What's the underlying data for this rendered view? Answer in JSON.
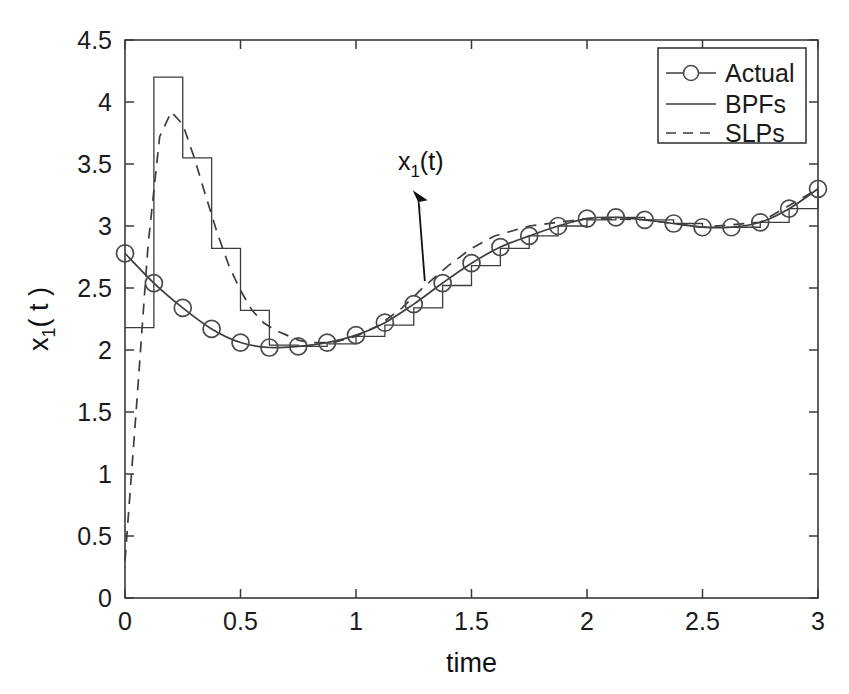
{
  "figure": {
    "background_color": "#ffffff",
    "axis_color": "#3a3a3a",
    "line_color": "#3d3d3d",
    "marker_color": "#4a4a4a"
  },
  "axes": {
    "x_label": "time",
    "y_label_base": "x",
    "y_label_sub": "1",
    "y_label_tail": "( t )",
    "x_ticks": [
      "0",
      "0.5",
      "1",
      "1.5",
      "2",
      "2.5",
      "3"
    ],
    "y_ticks": [
      "0",
      "0.5",
      "1",
      "1.5",
      "2",
      "2.5",
      "3",
      "3.5",
      "4",
      "4.5"
    ],
    "box": true,
    "grid": false
  },
  "annotation": {
    "text_base": "x",
    "text_sub": "1",
    "text_tail": "(t)",
    "arrow": "arrow-up-left"
  },
  "legend": {
    "position": "top-right",
    "entries": [
      {
        "label": "Actual",
        "style": "line-with-circle-marker"
      },
      {
        "label": "BPFs",
        "style": "solid-line"
      },
      {
        "label": "SLPs",
        "style": "dashed-line"
      }
    ]
  },
  "chart_data": {
    "type": "line",
    "title": "",
    "xlabel": "time",
    "ylabel": "x_1( t )",
    "xlim": [
      0,
      3
    ],
    "ylim": [
      0,
      4.5
    ],
    "xticks": [
      0,
      0.5,
      1,
      1.5,
      2,
      2.5,
      3
    ],
    "yticks": [
      0,
      0.5,
      1,
      1.5,
      2,
      2.5,
      3,
      3.5,
      4,
      4.5
    ],
    "grid": false,
    "legend_position": "upper right",
    "annotations": [
      {
        "text": "x_1(t)",
        "x": 1.28,
        "y": 3.45,
        "arrow_to_x": 1.22,
        "arrow_to_y": 2.62
      }
    ],
    "series": [
      {
        "name": "Actual",
        "style": "solid-with-circle-markers",
        "x": [
          0.0,
          0.125,
          0.25,
          0.375,
          0.5,
          0.625,
          0.75,
          0.875,
          1.0,
          1.125,
          1.25,
          1.375,
          1.5,
          1.625,
          1.75,
          1.875,
          2.0,
          2.125,
          2.25,
          2.375,
          2.5,
          2.625,
          2.75,
          2.875,
          3.0
        ],
        "y": [
          2.78,
          2.54,
          2.34,
          2.17,
          2.06,
          2.02,
          2.03,
          2.06,
          2.12,
          2.22,
          2.37,
          2.54,
          2.7,
          2.83,
          2.92,
          3.0,
          3.06,
          3.07,
          3.05,
          3.02,
          2.99,
          2.99,
          3.03,
          3.14,
          3.3
        ]
      },
      {
        "name": "BPFs",
        "style": "staircase",
        "x": [
          0.0,
          0.125,
          0.25,
          0.375,
          0.5,
          0.625,
          0.75,
          0.875,
          1.0,
          1.125,
          1.25,
          1.375,
          1.5,
          1.625,
          1.75,
          1.875,
          2.0,
          2.125,
          2.25,
          2.375,
          2.5,
          2.625,
          2.75,
          2.875,
          3.0
        ],
        "y": [
          2.18,
          4.2,
          3.55,
          2.82,
          2.32,
          2.04,
          2.03,
          2.05,
          2.11,
          2.2,
          2.34,
          2.52,
          2.68,
          2.82,
          2.92,
          3.0,
          3.05,
          3.07,
          3.05,
          3.02,
          2.99,
          2.99,
          3.03,
          3.14,
          3.3
        ]
      },
      {
        "name": "SLPs",
        "style": "dashed",
        "x": [
          0.0,
          0.05,
          0.1,
          0.15,
          0.2,
          0.25,
          0.3,
          0.35,
          0.4,
          0.45,
          0.5,
          0.55,
          0.6,
          0.65,
          0.7,
          0.75,
          0.8,
          0.9,
          1.0,
          1.1,
          1.2,
          1.3,
          1.4,
          1.5,
          1.6,
          1.75,
          2.0,
          2.25,
          2.5,
          2.75,
          3.0
        ],
        "y": [
          0.3,
          1.55,
          2.85,
          3.72,
          3.92,
          3.82,
          3.55,
          3.24,
          2.94,
          2.68,
          2.48,
          2.32,
          2.22,
          2.16,
          2.12,
          2.08,
          2.06,
          2.06,
          2.11,
          2.2,
          2.34,
          2.52,
          2.68,
          2.82,
          2.92,
          3.0,
          3.06,
          3.05,
          2.99,
          3.03,
          3.3
        ]
      }
    ]
  }
}
